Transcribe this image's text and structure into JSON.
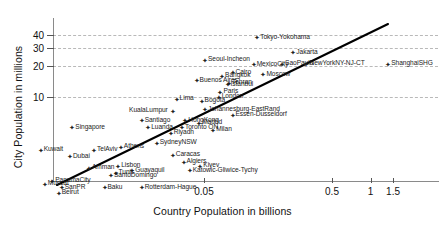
{
  "chart_data": {
    "type": "scatter",
    "title": "",
    "xlabel": "Country Population in billions",
    "ylabel": "City Population in millions",
    "xscale": "log",
    "yscale": "log",
    "xticks": [
      0.05,
      0.5,
      1,
      1.5
    ],
    "xticklabels": [
      "0.05",
      "0.5",
      "1",
      "1.5"
    ],
    "yticks": [
      10,
      20,
      30,
      40
    ],
    "yticklabels": [
      "10",
      "20",
      "30",
      "40"
    ],
    "grid": "horizontal-dashed",
    "legend": "none",
    "trendline": {
      "visible": true,
      "style": "solid-black"
    },
    "points": [
      {
        "label": "Tokyo-Yokohama",
        "x": 0.128,
        "y": 37.0,
        "side": "right"
      },
      {
        "label": "Jakarta",
        "x": 0.245,
        "y": 26.5,
        "side": "right"
      },
      {
        "label": "Seoul-Incheon",
        "x": 0.05,
        "y": 22.5,
        "side": "right"
      },
      {
        "label": "ShanghaiSHG",
        "x": 1.35,
        "y": 20.5,
        "side": "right"
      },
      {
        "label": "MexicoCity",
        "x": 0.12,
        "y": 20.4,
        "side": "right"
      },
      {
        "label": "SaoPaulo",
        "x": 0.2,
        "y": 20.6,
        "side": "right"
      },
      {
        "label": "NewYorkNY-NJ-CT",
        "x": 0.31,
        "y": 20.6,
        "side": "right"
      },
      {
        "label": "Moscow",
        "x": 0.143,
        "y": 16.2,
        "side": "right"
      },
      {
        "label": "Cairo",
        "x": 0.082,
        "y": 17.0,
        "side": "right"
      },
      {
        "label": "Bangkok",
        "x": 0.068,
        "y": 15.8,
        "side": "right"
      },
      {
        "label": "Buenos Aires",
        "x": 0.043,
        "y": 14.3,
        "side": "right"
      },
      {
        "label": "Tehran",
        "x": 0.077,
        "y": 13.5,
        "side": "right"
      },
      {
        "label": "Istanbul",
        "x": 0.075,
        "y": 13.0,
        "side": "right"
      },
      {
        "label": "Paris",
        "x": 0.066,
        "y": 11.0,
        "side": "right"
      },
      {
        "label": "London",
        "x": 0.064,
        "y": 9.8,
        "side": "right"
      },
      {
        "label": "Lima",
        "x": 0.03,
        "y": 9.4,
        "side": "right"
      },
      {
        "label": "Bogota",
        "x": 0.047,
        "y": 9.0,
        "side": "right"
      },
      {
        "label": "Johannesburg-EastRand",
        "x": 0.05,
        "y": 7.4,
        "side": "right"
      },
      {
        "label": "KualaLumpur",
        "x": 0.028,
        "y": 7.2,
        "side": "left"
      },
      {
        "label": "Essen-Dusseldorf",
        "x": 0.082,
        "y": 6.6,
        "side": "right"
      },
      {
        "label": "Santiago",
        "x": 0.016,
        "y": 5.8,
        "side": "right"
      },
      {
        "label": "HongKong",
        "x": 0.035,
        "y": 5.8,
        "side": "right"
      },
      {
        "label": "Madrid",
        "x": 0.045,
        "y": 5.5,
        "side": "right"
      },
      {
        "label": "Toronto ON",
        "x": 0.033,
        "y": 5.0,
        "side": "right"
      },
      {
        "label": "Luanda",
        "x": 0.018,
        "y": 5.0,
        "side": "right"
      },
      {
        "label": "Milan",
        "x": 0.058,
        "y": 4.7,
        "side": "right"
      },
      {
        "label": "Riyadh",
        "x": 0.027,
        "y": 4.4,
        "side": "right"
      },
      {
        "label": "Singapore",
        "x": 0.0046,
        "y": 5.0,
        "side": "right"
      },
      {
        "label": "Kuwait",
        "x": 0.0026,
        "y": 3.0,
        "side": "right"
      },
      {
        "label": "SydneyNSW",
        "x": 0.021,
        "y": 3.5,
        "side": "right"
      },
      {
        "label": "Athens",
        "x": 0.011,
        "y": 3.2,
        "side": "right"
      },
      {
        "label": "TelAviv",
        "x": 0.0068,
        "y": 3.0,
        "side": "right"
      },
      {
        "label": "Caracas",
        "x": 0.028,
        "y": 2.7,
        "side": "right"
      },
      {
        "label": "Dubai",
        "x": 0.0044,
        "y": 2.6,
        "side": "right"
      },
      {
        "label": "Algiers",
        "x": 0.034,
        "y": 2.3,
        "side": "right"
      },
      {
        "label": "Kiyev",
        "x": 0.046,
        "y": 2.1,
        "side": "right"
      },
      {
        "label": "Lisbon",
        "x": 0.0105,
        "y": 2.1,
        "side": "right"
      },
      {
        "label": "Amman",
        "x": 0.0062,
        "y": 2.0,
        "side": "right"
      },
      {
        "label": "Katowic-Gliwice-Tychy",
        "x": 0.038,
        "y": 1.9,
        "side": "right"
      },
      {
        "label": "Guayaquil",
        "x": 0.0135,
        "y": 1.9,
        "side": "right"
      },
      {
        "label": "Tunis",
        "x": 0.01,
        "y": 1.8,
        "side": "right"
      },
      {
        "label": "SantoDomingo",
        "x": 0.0092,
        "y": 1.7,
        "side": "right"
      },
      {
        "label": "PanamaCity",
        "x": 0.0032,
        "y": 1.5,
        "side": "right"
      },
      {
        "label": "Muscat",
        "x": 0.0028,
        "y": 1.4,
        "side": "right"
      },
      {
        "label": "Rotterdam-Hague",
        "x": 0.016,
        "y": 1.3,
        "side": "right"
      },
      {
        "label": "Baku",
        "x": 0.0082,
        "y": 1.3,
        "side": "right"
      },
      {
        "label": "SanPR",
        "x": 0.0038,
        "y": 1.3,
        "side": "right"
      },
      {
        "label": "Beirut",
        "x": 0.0036,
        "y": 1.15,
        "side": "right"
      }
    ]
  }
}
